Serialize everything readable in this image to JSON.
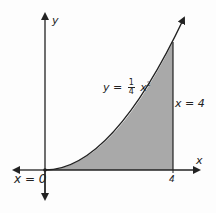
{
  "diagram": {
    "axes": {
      "x_label": "x",
      "y_label": "y"
    },
    "curve": {
      "label_prefix": "y =",
      "frac_num": "1",
      "frac_den": "4",
      "var": "x",
      "exponent": "2",
      "equation": "y = 1/4 x^2"
    },
    "bounds": {
      "left_label": "x = 0",
      "right_label": "x = 4"
    },
    "ticks": {
      "x_tick": "4"
    },
    "colors": {
      "shade": "#a9a9a9",
      "line": "#222222",
      "background": "#fdfdfd"
    }
  }
}
